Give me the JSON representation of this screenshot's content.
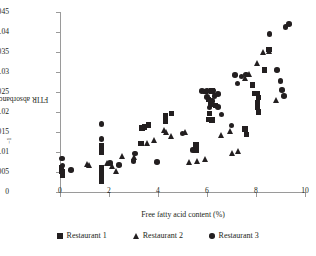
{
  "chart_data": {
    "type": "scatter",
    "title": "",
    "xlabel": "Free fatty acid content (%)",
    "ylabel": "FTIR absorbance at 3300 cm",
    "ylabel_exponent": "−1",
    "xlim": [
      0,
      10
    ],
    "ylim": [
      0,
      0.045
    ],
    "xticks": [
      0,
      2,
      4,
      6,
      8,
      10
    ],
    "xtick_labels": [
      "0",
      "2",
      "4",
      "6",
      "8",
      "10"
    ],
    "yticks": [
      0,
      0.005,
      0.01,
      0.015,
      0.02,
      0.025,
      0.03,
      0.035,
      0.04,
      0.045
    ],
    "ytick_labels": [
      "0",
      "0.005",
      "0.01",
      "0.015",
      "0.02",
      "0.025",
      "0.03",
      "0.035",
      "0.04",
      "0.045"
    ],
    "grid": false,
    "legend_position": "bottom",
    "series": [
      {
        "name": "Restaurant 1",
        "marker": "square",
        "color": "#231f20",
        "points": [
          [
            0.05,
            0.006
          ],
          [
            0.08,
            0.0052
          ],
          [
            0.1,
            0.0042
          ],
          [
            1.7,
            0.0115
          ],
          [
            1.7,
            0.01
          ],
          [
            1.7,
            0.0062
          ],
          [
            1.7,
            0.0052
          ],
          [
            1.7,
            0.004
          ],
          [
            1.7,
            0.0027
          ],
          [
            3.35,
            0.016
          ],
          [
            3.45,
            0.0163
          ],
          [
            3.6,
            0.0168
          ],
          [
            3.3,
            0.0121
          ],
          [
            4.3,
            0.019
          ],
          [
            4.55,
            0.0196
          ],
          [
            4.3,
            0.0178
          ],
          [
            5.55,
            0.0118
          ],
          [
            5.55,
            0.0104
          ],
          [
            5.95,
            0.0251
          ],
          [
            6.2,
            0.0253
          ],
          [
            6.05,
            0.0232
          ],
          [
            6.15,
            0.022
          ],
          [
            6.35,
            0.0217
          ],
          [
            6.1,
            0.0196
          ],
          [
            6.05,
            0.0182
          ],
          [
            6.2,
            0.018
          ],
          [
            7.55,
            0.0158
          ],
          [
            7.6,
            0.0144
          ],
          [
            7.85,
            0.0268
          ],
          [
            7.95,
            0.0247
          ],
          [
            8.05,
            0.0246
          ],
          [
            8.1,
            0.0236
          ],
          [
            8.05,
            0.0224
          ],
          [
            8.05,
            0.0211
          ],
          [
            8.1,
            0.02
          ],
          [
            8.35,
            0.0305
          ],
          [
            8.5,
            0.0356
          ],
          [
            8.55,
            0.0356
          ]
        ]
      },
      {
        "name": "Restaurant 2",
        "marker": "triangle",
        "color": "#231f20",
        "points": [
          [
            1.12,
            0.0071
          ],
          [
            1.18,
            0.0068
          ],
          [
            1.95,
            0.0073
          ],
          [
            2.15,
            0.0064
          ],
          [
            2.3,
            0.0052
          ],
          [
            2.55,
            0.009
          ],
          [
            3.05,
            0.0087
          ],
          [
            3.55,
            0.0122
          ],
          [
            3.85,
            0.013
          ],
          [
            4.25,
            0.0155
          ],
          [
            4.35,
            0.015
          ],
          [
            4.55,
            0.0141
          ],
          [
            5.1,
            0.015
          ],
          [
            5.3,
            0.0074
          ],
          [
            5.6,
            0.0077
          ],
          [
            5.95,
            0.0083
          ],
          [
            6.6,
            0.0142
          ],
          [
            6.95,
            0.0152
          ],
          [
            7.05,
            0.0098
          ],
          [
            7.3,
            0.0103
          ],
          [
            7.55,
            0.0285
          ],
          [
            7.75,
            0.0296
          ],
          [
            8.05,
            0.0322
          ],
          [
            8.3,
            0.035
          ],
          [
            8.55,
            0.0352
          ],
          [
            8.85,
            0.023
          ]
        ]
      },
      {
        "name": "Restaurant 3",
        "marker": "circle",
        "color": "#231f20",
        "points": [
          [
            0.08,
            0.0084
          ],
          [
            0.1,
            0.0066
          ],
          [
            0.45,
            0.0055
          ],
          [
            1.7,
            0.017
          ],
          [
            1.7,
            0.0132
          ],
          [
            2.05,
            0.0072
          ],
          [
            2.4,
            0.0068
          ],
          [
            3.0,
            0.0077
          ],
          [
            3.05,
            0.0096
          ],
          [
            3.95,
            0.0075
          ],
          [
            5.0,
            0.0146
          ],
          [
            5.4,
            0.0105
          ],
          [
            5.8,
            0.0253
          ],
          [
            6.0,
            0.0253
          ],
          [
            6.25,
            0.0254
          ],
          [
            6.0,
            0.0238
          ],
          [
            6.2,
            0.0228
          ],
          [
            6.1,
            0.0211
          ],
          [
            6.45,
            0.0213
          ],
          [
            6.45,
            0.0245
          ],
          [
            6.3,
            0.024
          ],
          [
            6.6,
            0.0194
          ],
          [
            7.0,
            0.0166
          ],
          [
            7.25,
            0.0271
          ],
          [
            7.4,
            0.0289
          ],
          [
            7.6,
            0.0294
          ],
          [
            7.15,
            0.0292
          ],
          [
            8.85,
            0.0305
          ],
          [
            9.0,
            0.0277
          ],
          [
            9.2,
            0.0413
          ],
          [
            9.35,
            0.042
          ],
          [
            8.55,
            0.0395
          ],
          [
            9.05,
            0.0255
          ],
          [
            9.15,
            0.024
          ]
        ]
      }
    ]
  },
  "legend": {
    "items": [
      {
        "label": "Restaurant 1",
        "marker": "square"
      },
      {
        "label": "Restaurant 2",
        "marker": "triangle"
      },
      {
        "label": "Restaurant 3",
        "marker": "circle"
      }
    ]
  }
}
